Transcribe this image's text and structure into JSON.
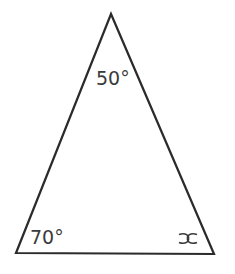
{
  "diagram": {
    "type": "triangle",
    "vertices": {
      "top": [
        111,
        14
      ],
      "bottom_left": [
        16,
        253
      ],
      "bottom_right": [
        214,
        254
      ]
    },
    "stroke_color": "#2b2b2b",
    "label_color": "#3a3a3a",
    "angles": {
      "top": "50°",
      "bottom_left": "70°",
      "bottom_right": "x"
    }
  }
}
